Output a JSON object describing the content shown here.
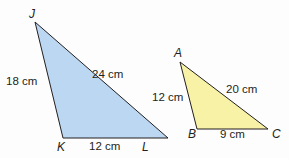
{
  "colors": {
    "triangle_jkl_fill": "#bcd7f2",
    "triangle_abc_fill": "#f7f2a6",
    "stroke": "#231f20",
    "text": "#231f20"
  },
  "triangle_jkl": {
    "vertices": {
      "J": "J",
      "K": "K",
      "L": "L"
    },
    "sides": {
      "JK": "18 cm",
      "JL": "24 cm",
      "KL": "12 cm"
    }
  },
  "triangle_abc": {
    "vertices": {
      "A": "A",
      "B": "B",
      "C": "C"
    },
    "sides": {
      "AB": "12 cm",
      "AC": "20 cm",
      "BC": "9 cm"
    }
  }
}
